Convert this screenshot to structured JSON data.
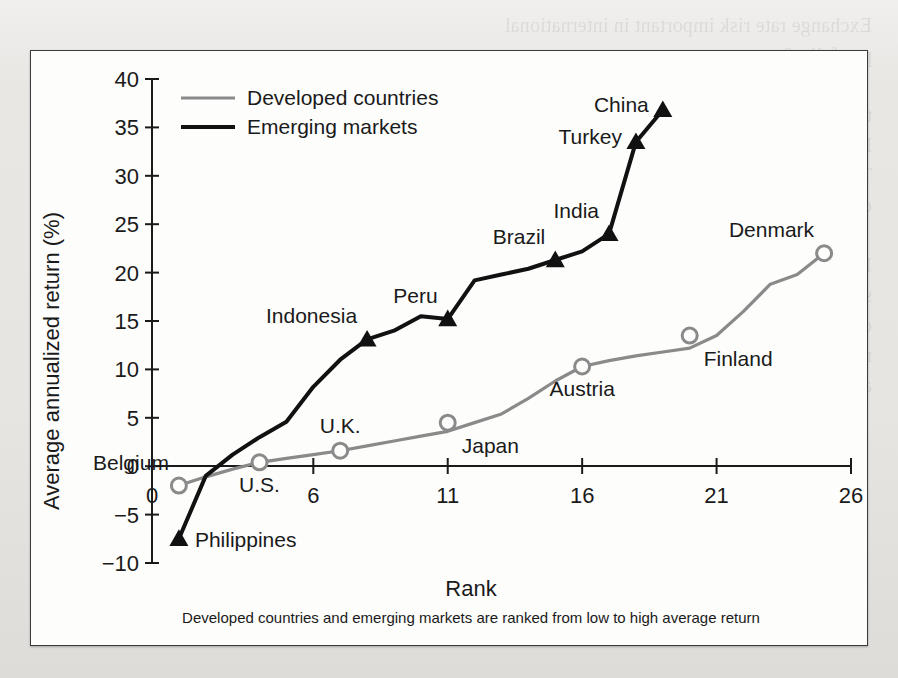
{
  "figure": {
    "x_axis_title": "Rank",
    "y_axis_title": "Average annualized return (%)",
    "caption": "Developed countries and emerging markets are ranked from low to high average return"
  },
  "legend": {
    "position": "top-left-inside",
    "entries": [
      {
        "label": "Developed countries",
        "color": "#8a8a8a",
        "marker": "circle-open"
      },
      {
        "label": "Emerging markets",
        "color": "#111111",
        "marker": "triangle-filled"
      }
    ]
  },
  "chart_data": {
    "type": "line",
    "title": "",
    "subtitle": "",
    "xlabel": "Rank",
    "ylabel": "Average annualized return (%)",
    "xlim": [
      0,
      26
    ],
    "ylim": [
      -10,
      40
    ],
    "xticks": [
      0,
      6,
      11,
      16,
      21,
      26
    ],
    "xtick_labels": [
      "0",
      "6",
      "11",
      "16",
      "21",
      "26"
    ],
    "yticks": [
      -10,
      -5,
      0,
      5,
      10,
      15,
      20,
      25,
      30,
      35,
      40
    ],
    "ytick_labels": [
      "−10",
      "−5",
      "0",
      "5",
      "10",
      "15",
      "20",
      "25",
      "30",
      "35",
      "40"
    ],
    "grid": false,
    "legend_entries": [
      "Developed countries",
      "Emerging markets"
    ],
    "series": [
      {
        "name": "Developed countries",
        "color": "#8a8a8a",
        "marker": "circle-open",
        "x": [
          1,
          2,
          3,
          4,
          5,
          6,
          7,
          8,
          9,
          10,
          11,
          12,
          13,
          14,
          15,
          16,
          17,
          18,
          19,
          20,
          21,
          22,
          23,
          24,
          25
        ],
        "y": [
          -2.0,
          -1.1,
          -0.3,
          0.4,
          0.8,
          1.2,
          1.6,
          2.1,
          2.6,
          3.1,
          3.6,
          4.5,
          5.4,
          7.0,
          8.8,
          10.3,
          10.9,
          11.4,
          11.8,
          12.2,
          13.5,
          16.0,
          18.8,
          19.8,
          22.0
        ],
        "labeled_points": [
          {
            "label": "Belgium",
            "x": 1,
            "y": -2.0
          },
          {
            "label": "U.S.",
            "x": 4,
            "y": 0.4
          },
          {
            "label": "U.K.",
            "x": 7,
            "y": 1.6
          },
          {
            "label": "Japan",
            "x": 11,
            "y": 4.5
          },
          {
            "label": "Austria",
            "x": 16,
            "y": 10.3
          },
          {
            "label": "Finland",
            "x": 20,
            "y": 13.5
          },
          {
            "label": "Denmark",
            "x": 25,
            "y": 22.0
          }
        ]
      },
      {
        "name": "Emerging markets",
        "color": "#111111",
        "marker": "triangle-filled",
        "x": [
          1,
          2,
          3,
          4,
          5,
          6,
          7,
          8,
          9,
          10,
          11,
          12,
          13,
          14,
          15,
          16,
          17,
          18,
          19
        ],
        "y": [
          -7.5,
          -1.0,
          1.2,
          3.0,
          4.6,
          8.2,
          11.0,
          13.1,
          14.0,
          15.5,
          15.2,
          19.2,
          19.8,
          20.4,
          21.3,
          22.2,
          24.0,
          33.5,
          36.8
        ],
        "labeled_points": [
          {
            "label": "Philippines",
            "x": 1,
            "y": -7.5
          },
          {
            "label": "Indonesia",
            "x": 8,
            "y": 13.1
          },
          {
            "label": "Peru",
            "x": 11,
            "y": 15.2
          },
          {
            "label": "Brazil",
            "x": 15,
            "y": 21.3
          },
          {
            "label": "India",
            "x": 17,
            "y": 24.0
          },
          {
            "label": "Turkey",
            "x": 18,
            "y": 33.5
          },
          {
            "label": "China",
            "x": 19,
            "y": 36.8
          }
        ]
      }
    ],
    "annotations": [
      {
        "text": "Belgium",
        "x": 1,
        "y": -2.0,
        "placement": "above-left"
      },
      {
        "text": "Philippines",
        "x": 1,
        "y": -7.5,
        "placement": "right"
      },
      {
        "text": "U.S.",
        "x": 4,
        "y": 0.4,
        "placement": "below"
      },
      {
        "text": "U.K.",
        "x": 7,
        "y": 1.6,
        "placement": "above"
      },
      {
        "text": "Japan",
        "x": 11,
        "y": 4.5,
        "placement": "below-right"
      },
      {
        "text": "Austria",
        "x": 16,
        "y": 10.3,
        "placement": "below"
      },
      {
        "text": "Finland",
        "x": 20,
        "y": 13.5,
        "placement": "below-right"
      },
      {
        "text": "Denmark",
        "x": 25,
        "y": 22.0,
        "placement": "above-left"
      },
      {
        "text": "Indonesia",
        "x": 8,
        "y": 13.1,
        "placement": "above-left"
      },
      {
        "text": "Peru",
        "x": 11,
        "y": 15.2,
        "placement": "above-left"
      },
      {
        "text": "Brazil",
        "x": 15,
        "y": 21.3,
        "placement": "above-left"
      },
      {
        "text": "India",
        "x": 17,
        "y": 24.0,
        "placement": "above-left"
      },
      {
        "text": "Turkey",
        "x": 18,
        "y": 33.5,
        "placement": "left"
      },
      {
        "text": "China",
        "x": 19,
        "y": 36.8,
        "placement": "left"
      }
    ]
  },
  "bleed_text": "Exchange rate risk important in international\nportfolios?\n\nthe global market portfolio has a return volatility that is\nlower than the volatility of each of the individual assets.\nThe risk reduction effect is more pronounced the lower the\ncorrelation between the asset returns in the portfolio.\n\nIn Figure 7.10 we compare the annualized average return\nstock returns to the risk and local return volatilities\nof the world market. It is evident that in many emerging\nmarkets the risk reduction effect can be substantial if one\nadds foreign assets to the portfolio."
}
